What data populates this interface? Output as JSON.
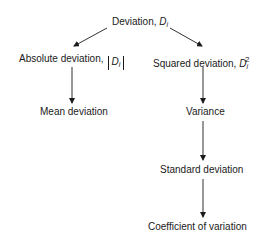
{
  "diagram": {
    "root": {
      "label": "Deviation, ",
      "symbol": "D",
      "subscript": "i"
    },
    "left_branch": {
      "label": "Absolute deviation,",
      "symbol": "D",
      "subscript": "i",
      "notation": "absolute value"
    },
    "right_branch": {
      "label": "Squared deviation, ",
      "symbol": "D",
      "subscript": "i",
      "superscript": "2"
    },
    "left_result": {
      "label": "Mean deviation"
    },
    "right_chain": [
      {
        "label": "Variance"
      },
      {
        "label": "Standard deviation"
      },
      {
        "label": "Coefficient of variation"
      }
    ],
    "edges": [
      {
        "from": "Deviation",
        "to": "Absolute deviation"
      },
      {
        "from": "Deviation",
        "to": "Squared deviation"
      },
      {
        "from": "Absolute deviation",
        "to": "Mean deviation"
      },
      {
        "from": "Squared deviation",
        "to": "Variance"
      },
      {
        "from": "Variance",
        "to": "Standard deviation"
      },
      {
        "from": "Standard deviation",
        "to": "Coefficient of variation"
      }
    ],
    "line_color": "#1a1a1a"
  }
}
